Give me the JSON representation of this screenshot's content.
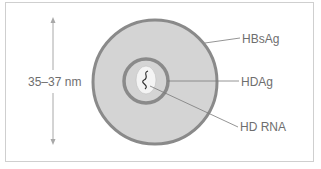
{
  "diagram": {
    "size_label": "35–37 nm",
    "labels": [
      {
        "id": "hbsag",
        "text": "HBsAg"
      },
      {
        "id": "hdag",
        "text": "HDAg"
      },
      {
        "id": "hdrna",
        "text": "HD RNA"
      }
    ],
    "colors": {
      "outer_ring": "#8a8a8a",
      "outer_fill": "#d4d4d4",
      "inner_ring": "#8a8a8a",
      "rna_fill": "#f4f4f4",
      "leader_lines": "#7a7a7a",
      "arrow": "#a0a0a0",
      "text": "#6e6e6e",
      "frame": "#cfcfcf"
    }
  }
}
